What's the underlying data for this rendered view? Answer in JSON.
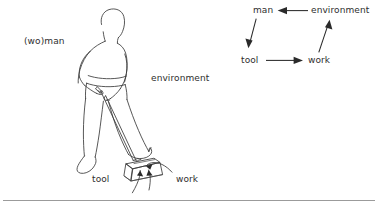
{
  "figure": {
    "type": "diagram",
    "illustration": {
      "labels": {
        "person": "(wo)man",
        "environment": "environment",
        "tool": "tool",
        "work": "work"
      }
    },
    "cycle_diagram": {
      "nodes": {
        "man": "man",
        "environment": "environment",
        "tool": "tool",
        "work": "work"
      },
      "edges": [
        {
          "from": "environment",
          "to": "man",
          "style": "straight-horizontal"
        },
        {
          "from": "man",
          "to": "tool",
          "style": "straight-diagonal"
        },
        {
          "from": "tool",
          "to": "work",
          "style": "straight-horizontal"
        },
        {
          "from": "work",
          "to": "environment",
          "style": "straight-diagonal"
        }
      ]
    }
  },
  "style": {
    "ink_color": "#3a3a3a",
    "arrow_color": "#2a2a2a",
    "text_color": "#2e2e2e",
    "background": "#ffffff",
    "divider_color": "#9b9b9b"
  }
}
